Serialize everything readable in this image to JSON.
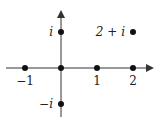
{
  "diagram": {
    "axes": {
      "origin_px": [
        61,
        68
      ],
      "unit_px": 36,
      "x_range_px": [
        6,
        152
      ],
      "y_range_px": [
        12,
        117
      ]
    },
    "points": [
      {
        "name": "minus-one",
        "re": -1,
        "im": 0,
        "label": "−1",
        "label_pos": "below"
      },
      {
        "name": "origin",
        "re": 0,
        "im": 0,
        "label": "",
        "label_pos": "none"
      },
      {
        "name": "one",
        "re": 1,
        "im": 0,
        "label": "1",
        "label_pos": "below"
      },
      {
        "name": "two",
        "re": 2,
        "im": 0,
        "label": "2",
        "label_pos": "below"
      },
      {
        "name": "i",
        "re": 0,
        "im": 1,
        "label": "i",
        "label_pos": "left"
      },
      {
        "name": "minus-i",
        "re": 0,
        "im": -1,
        "label": "−i",
        "label_pos": "left"
      },
      {
        "name": "two-plus-i",
        "re": 2,
        "im": 1,
        "label": "2 + i",
        "label_pos": "left"
      }
    ],
    "colors": {
      "stroke": "#333333",
      "point": "#111111"
    }
  }
}
